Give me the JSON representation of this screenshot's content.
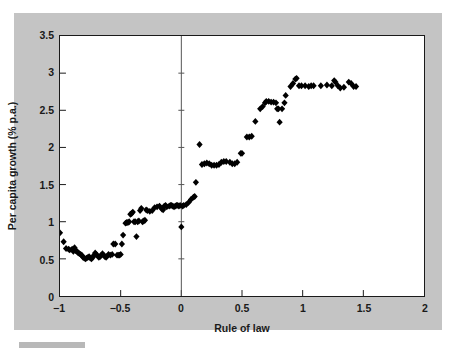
{
  "figure": {
    "background_color": "#ffffff",
    "panel_color": "#c4c4c4",
    "plot_background": "#ffffff",
    "axis_color": "#1a1a1a",
    "marker_color": "#000000"
  },
  "chart_data": {
    "type": "scatter",
    "title": "",
    "subtitle": "",
    "xlabel": "Rule of law",
    "ylabel": "Per capita growth (% p.a.)",
    "xlim": [
      -1,
      2
    ],
    "ylim": [
      0,
      3.5
    ],
    "xticks": [
      -1,
      -0.5,
      0,
      0.5,
      1,
      1.5,
      2
    ],
    "xticklabels": [
      "−1",
      "−0.5",
      "0",
      "0.5",
      "1",
      "1.5",
      "2"
    ],
    "yticks": [
      0,
      0.5,
      1,
      1.5,
      2,
      2.5,
      3,
      3.5
    ],
    "yticklabels": [
      "0",
      "0.5",
      "1",
      "1.5",
      "2",
      "2.5",
      "3",
      "3.5"
    ],
    "grid": false,
    "legend": null,
    "legend_position": "none",
    "marker_shape": "diamond",
    "marker_size": 5,
    "annotations": [
      {
        "type": "vline",
        "x": 0,
        "label": "",
        "color": "#555555"
      }
    ],
    "points": [
      [
        -1.0,
        0.85
      ],
      [
        -0.97,
        0.73
      ],
      [
        -0.95,
        0.64
      ],
      [
        -0.93,
        0.63
      ],
      [
        -0.92,
        0.62
      ],
      [
        -0.9,
        0.63
      ],
      [
        -0.89,
        0.6
      ],
      [
        -0.88,
        0.65
      ],
      [
        -0.87,
        0.61
      ],
      [
        -0.86,
        0.6
      ],
      [
        -0.85,
        0.58
      ],
      [
        -0.84,
        0.57
      ],
      [
        -0.83,
        0.56
      ],
      [
        -0.82,
        0.55
      ],
      [
        -0.81,
        0.52
      ],
      [
        -0.8,
        0.51
      ],
      [
        -0.79,
        0.5
      ],
      [
        -0.78,
        0.51
      ],
      [
        -0.77,
        0.52
      ],
      [
        -0.76,
        0.53
      ],
      [
        -0.75,
        0.51
      ],
      [
        -0.74,
        0.5
      ],
      [
        -0.73,
        0.52
      ],
      [
        -0.72,
        0.55
      ],
      [
        -0.71,
        0.58
      ],
      [
        -0.7,
        0.56
      ],
      [
        -0.69,
        0.54
      ],
      [
        -0.68,
        0.52
      ],
      [
        -0.67,
        0.53
      ],
      [
        -0.66,
        0.55
      ],
      [
        -0.65,
        0.57
      ],
      [
        -0.64,
        0.55
      ],
      [
        -0.63,
        0.53
      ],
      [
        -0.62,
        0.52
      ],
      [
        -0.61,
        0.54
      ],
      [
        -0.6,
        0.56
      ],
      [
        -0.585,
        0.55
      ],
      [
        -0.57,
        0.56
      ],
      [
        -0.56,
        0.7
      ],
      [
        -0.545,
        0.7
      ],
      [
        -0.53,
        0.55
      ],
      [
        -0.52,
        0.55
      ],
      [
        -0.51,
        0.55
      ],
      [
        -0.5,
        0.56
      ],
      [
        -0.49,
        0.7
      ],
      [
        -0.48,
        0.82
      ],
      [
        -0.46,
        0.98
      ],
      [
        -0.45,
        0.99
      ],
      [
        -0.44,
        0.99
      ],
      [
        -0.43,
        1.0
      ],
      [
        -0.42,
        1.1
      ],
      [
        -0.41,
        1.11
      ],
      [
        -0.4,
        1.13
      ],
      [
        -0.39,
        1.0
      ],
      [
        -0.38,
        1.0
      ],
      [
        -0.37,
        0.8
      ],
      [
        -0.36,
        1.0
      ],
      [
        -0.35,
        1.01
      ],
      [
        -0.34,
        1.15
      ],
      [
        -0.33,
        1.18
      ],
      [
        -0.32,
        1.0
      ],
      [
        -0.31,
        1.01
      ],
      [
        -0.3,
        1.02
      ],
      [
        -0.29,
        1.16
      ],
      [
        -0.28,
        1.15
      ],
      [
        -0.26,
        1.14
      ],
      [
        -0.24,
        1.15
      ],
      [
        -0.22,
        1.19
      ],
      [
        -0.2,
        1.2
      ],
      [
        -0.18,
        1.21
      ],
      [
        -0.16,
        1.17
      ],
      [
        -0.15,
        1.16
      ],
      [
        -0.14,
        1.21
      ],
      [
        -0.13,
        1.22
      ],
      [
        -0.12,
        1.2
      ],
      [
        -0.1,
        1.21
      ],
      [
        -0.09,
        1.22
      ],
      [
        -0.08,
        1.22
      ],
      [
        -0.07,
        1.21
      ],
      [
        -0.06,
        1.2
      ],
      [
        -0.05,
        1.21
      ],
      [
        -0.04,
        1.22
      ],
      [
        -0.03,
        1.22
      ],
      [
        -0.02,
        1.21
      ],
      [
        -0.01,
        1.22
      ],
      [
        0.0,
        0.93
      ],
      [
        0.01,
        1.21
      ],
      [
        0.02,
        1.22
      ],
      [
        0.04,
        1.23
      ],
      [
        0.06,
        1.26
      ],
      [
        0.08,
        1.3
      ],
      [
        0.1,
        1.33
      ],
      [
        0.11,
        1.34
      ],
      [
        0.12,
        1.53
      ],
      [
        0.15,
        2.04
      ],
      [
        0.17,
        1.77
      ],
      [
        0.19,
        1.78
      ],
      [
        0.21,
        1.79
      ],
      [
        0.23,
        1.78
      ],
      [
        0.25,
        1.76
      ],
      [
        0.27,
        1.76
      ],
      [
        0.29,
        1.76
      ],
      [
        0.31,
        1.77
      ],
      [
        0.33,
        1.8
      ],
      [
        0.35,
        1.81
      ],
      [
        0.37,
        1.81
      ],
      [
        0.4,
        1.8
      ],
      [
        0.42,
        1.78
      ],
      [
        0.44,
        1.78
      ],
      [
        0.46,
        1.8
      ],
      [
        0.49,
        1.92
      ],
      [
        0.5,
        1.92
      ],
      [
        0.54,
        2.14
      ],
      [
        0.56,
        2.14
      ],
      [
        0.58,
        2.15
      ],
      [
        0.61,
        2.35
      ],
      [
        0.65,
        2.52
      ],
      [
        0.67,
        2.55
      ],
      [
        0.69,
        2.6
      ],
      [
        0.7,
        2.62
      ],
      [
        0.72,
        2.62
      ],
      [
        0.74,
        2.61
      ],
      [
        0.76,
        2.61
      ],
      [
        0.78,
        2.6
      ],
      [
        0.79,
        2.52
      ],
      [
        0.8,
        2.52
      ],
      [
        0.81,
        2.34
      ],
      [
        0.83,
        2.52
      ],
      [
        0.85,
        2.6
      ],
      [
        0.86,
        2.7
      ],
      [
        0.9,
        2.82
      ],
      [
        0.92,
        2.86
      ],
      [
        0.94,
        2.92
      ],
      [
        0.95,
        2.93
      ],
      [
        0.97,
        2.83
      ],
      [
        0.99,
        2.83
      ],
      [
        1.02,
        2.83
      ],
      [
        1.05,
        2.82
      ],
      [
        1.07,
        2.83
      ],
      [
        1.09,
        2.83
      ],
      [
        1.15,
        2.83
      ],
      [
        1.2,
        2.84
      ],
      [
        1.24,
        2.83
      ],
      [
        1.26,
        2.9
      ],
      [
        1.27,
        2.88
      ],
      [
        1.29,
        2.83
      ],
      [
        1.31,
        2.8
      ],
      [
        1.34,
        2.81
      ],
      [
        1.38,
        2.88
      ],
      [
        1.4,
        2.86
      ],
      [
        1.42,
        2.82
      ],
      [
        1.44,
        2.82
      ]
    ]
  }
}
